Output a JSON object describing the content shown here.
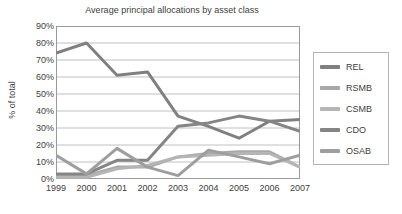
{
  "chart_data": {
    "type": "line",
    "title": "Average principal allocations by asset class",
    "xlabel": "",
    "ylabel": "% of total",
    "categories": [
      "1999",
      "2000",
      "2001",
      "2002",
      "2003",
      "2004",
      "2005",
      "2006",
      "2007"
    ],
    "ylim": [
      0,
      90
    ],
    "ytick_values": [
      0,
      10,
      20,
      30,
      40,
      50,
      60,
      70,
      80,
      90
    ],
    "ytick_labels": [
      "0%",
      "10%",
      "20%",
      "30%",
      "40%",
      "50%",
      "60%",
      "70%",
      "80%",
      "90%"
    ],
    "grid": true,
    "legend_position": "right",
    "series": [
      {
        "name": "REL",
        "color": "#808080",
        "values": [
          74,
          80,
          61,
          63,
          37,
          31,
          24,
          34,
          35
        ]
      },
      {
        "name": "RSMB",
        "color": "#a8a8a8",
        "values": [
          2,
          2,
          7,
          7,
          13,
          15,
          16,
          16,
          7
        ]
      },
      {
        "name": "CSMB",
        "color": "#b5b5b5",
        "values": [
          1,
          1,
          6,
          8,
          13,
          14,
          15,
          15,
          7
        ]
      },
      {
        "name": "CDO",
        "color": "#858585",
        "values": [
          3,
          3,
          11,
          11,
          31,
          33,
          37,
          34,
          28
        ]
      },
      {
        "name": "OSAB",
        "color": "#9e9e9e",
        "values": [
          14,
          3,
          18,
          7,
          2,
          17,
          13,
          9,
          14
        ]
      }
    ]
  },
  "legend": {
    "items": [
      {
        "label": "REL"
      },
      {
        "label": "RSMB"
      },
      {
        "label": "CSMB"
      },
      {
        "label": "CDO"
      },
      {
        "label": "OSAB"
      }
    ]
  },
  "colors": {
    "plot_border": "#9a9a9a",
    "gridline": "#b0b0b0",
    "legend_border": "#b4b4b4",
    "text": "#404040",
    "background": "#ffffff"
  }
}
